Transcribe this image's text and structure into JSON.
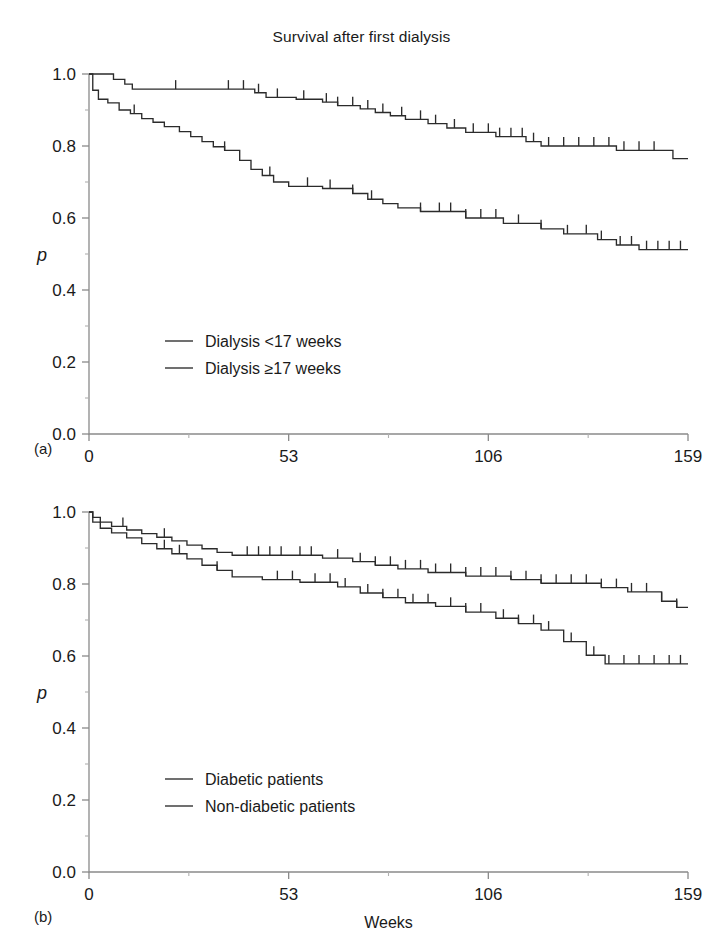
{
  "figure": {
    "title": "Survival after first dialysis",
    "background": "#ffffff",
    "line_color": "#2b2b2b",
    "axis_color": "#8a8a8a"
  },
  "panels": [
    {
      "tag": "(a)",
      "title": "Survival after first dialysis",
      "ylabel": "p",
      "xlabel": "Weeks"
    },
    {
      "tag": "(b)",
      "title": "",
      "ylabel": "p",
      "xlabel": "Weeks"
    }
  ],
  "axes": {
    "y_ticks": [
      "0.0",
      "0.2",
      "0.4",
      "0.6",
      "0.8",
      "1.0"
    ],
    "x_ticks": [
      "0",
      "53",
      "106",
      "159"
    ]
  },
  "legend_a": [
    {
      "label": "Dialysis <17 weeks"
    },
    {
      "label": "Dialysis ≥17 weeks"
    }
  ],
  "legend_b": [
    {
      "label": "Diabetic patients"
    },
    {
      "label": "Non-diabetic patients"
    }
  ],
  "chart_data": [
    {
      "type": "line",
      "plot_kind": "kaplan-meier-step",
      "panel": "(a)",
      "title": "Survival after first dialysis",
      "xlabel": "Weeks",
      "ylabel": "p",
      "xlim": [
        0,
        159
      ],
      "ylim": [
        0.0,
        1.0
      ],
      "xticks": [
        0,
        53,
        106,
        159
      ],
      "yticks": [
        0.0,
        0.2,
        0.4,
        0.6,
        0.8,
        1.0
      ],
      "grid": false,
      "legend_position": "inside-lower-left",
      "series": [
        {
          "name": "Dialysis <17 weeks",
          "points": [
            [
              0,
              1.0
            ],
            [
              6.5,
              1.0
            ],
            [
              6.5,
              0.985
            ],
            [
              9.5,
              0.985
            ],
            [
              9.5,
              0.972
            ],
            [
              11.5,
              0.972
            ],
            [
              11.5,
              0.958
            ],
            [
              18,
              0.958
            ],
            [
              18,
              0.958
            ],
            [
              44,
              0.958
            ],
            [
              44,
              0.948
            ],
            [
              47,
              0.948
            ],
            [
              47,
              0.935
            ],
            [
              55,
              0.935
            ],
            [
              55,
              0.93
            ],
            [
              62,
              0.93
            ],
            [
              62,
              0.922
            ],
            [
              66,
              0.922
            ],
            [
              66,
              0.912
            ],
            [
              72,
              0.912
            ],
            [
              72,
              0.903
            ],
            [
              76,
              0.903
            ],
            [
              76,
              0.893
            ],
            [
              80,
              0.893
            ],
            [
              80,
              0.884
            ],
            [
              84,
              0.884
            ],
            [
              84,
              0.874
            ],
            [
              90,
              0.874
            ],
            [
              90,
              0.862
            ],
            [
              95,
              0.862
            ],
            [
              95,
              0.85
            ],
            [
              100,
              0.85
            ],
            [
              100,
              0.838
            ],
            [
              108,
              0.838
            ],
            [
              108,
              0.826
            ],
            [
              116,
              0.826
            ],
            [
              116,
              0.812
            ],
            [
              120,
              0.812
            ],
            [
              120,
              0.8
            ],
            [
              140,
              0.8
            ],
            [
              140,
              0.788
            ],
            [
              152,
              0.788
            ],
            [
              155,
              0.788
            ],
            [
              155,
              0.765
            ],
            [
              159,
              0.765
            ]
          ],
          "censored_x": [
            23,
            37,
            41,
            45,
            50,
            57,
            63,
            66,
            70,
            74,
            78,
            83,
            88,
            92,
            97,
            102,
            106,
            109,
            112,
            115,
            118,
            122,
            126,
            130,
            134,
            138,
            142,
            146,
            150
          ]
        },
        {
          "name": "Dialysis ≥17 weeks",
          "points": [
            [
              0,
              1.0
            ],
            [
              1,
              1.0
            ],
            [
              1,
              0.955
            ],
            [
              2.5,
              0.955
            ],
            [
              2.5,
              0.93
            ],
            [
              5,
              0.93
            ],
            [
              5,
              0.92
            ],
            [
              8,
              0.92
            ],
            [
              8,
              0.9
            ],
            [
              11,
              0.9
            ],
            [
              11,
              0.89
            ],
            [
              14,
              0.89
            ],
            [
              14,
              0.876
            ],
            [
              17,
              0.876
            ],
            [
              17,
              0.866
            ],
            [
              20,
              0.866
            ],
            [
              20,
              0.854
            ],
            [
              24,
              0.854
            ],
            [
              24,
              0.84
            ],
            [
              27,
              0.84
            ],
            [
              27,
              0.826
            ],
            [
              30,
              0.826
            ],
            [
              30,
              0.812
            ],
            [
              33,
              0.812
            ],
            [
              33,
              0.798
            ],
            [
              36,
              0.798
            ],
            [
              36,
              0.788
            ],
            [
              40,
              0.788
            ],
            [
              40,
              0.76
            ],
            [
              43,
              0.76
            ],
            [
              43,
              0.735
            ],
            [
              46,
              0.735
            ],
            [
              46,
              0.718
            ],
            [
              49,
              0.718
            ],
            [
              49,
              0.7
            ],
            [
              53,
              0.7
            ],
            [
              53,
              0.688
            ],
            [
              62,
              0.688
            ],
            [
              62,
              0.682
            ],
            [
              70,
              0.682
            ],
            [
              70,
              0.668
            ],
            [
              74,
              0.668
            ],
            [
              74,
              0.652
            ],
            [
              78,
              0.652
            ],
            [
              78,
              0.64
            ],
            [
              82,
              0.64
            ],
            [
              82,
              0.628
            ],
            [
              88,
              0.628
            ],
            [
              88,
              0.618
            ],
            [
              100,
              0.618
            ],
            [
              100,
              0.6
            ],
            [
              110,
              0.6
            ],
            [
              110,
              0.585
            ],
            [
              120,
              0.585
            ],
            [
              120,
              0.57
            ],
            [
              126,
              0.57
            ],
            [
              126,
              0.556
            ],
            [
              135,
              0.556
            ],
            [
              135,
              0.54
            ],
            [
              140,
              0.54
            ],
            [
              140,
              0.525
            ],
            [
              146,
              0.525
            ],
            [
              146,
              0.512
            ],
            [
              159,
              0.512
            ]
          ],
          "censored_x": [
            12,
            36,
            48,
            58,
            64,
            70,
            75,
            88,
            93,
            96,
            100,
            104,
            108,
            114,
            120,
            127,
            132,
            136,
            141,
            144,
            148,
            151,
            154,
            157
          ]
        }
      ]
    },
    {
      "type": "line",
      "plot_kind": "kaplan-meier-step",
      "panel": "(b)",
      "title": "",
      "xlabel": "Weeks",
      "ylabel": "p",
      "xlim": [
        0,
        159
      ],
      "ylim": [
        0.0,
        1.0
      ],
      "xticks": [
        0,
        53,
        106,
        159
      ],
      "yticks": [
        0.0,
        0.2,
        0.4,
        0.6,
        0.8,
        1.0
      ],
      "grid": false,
      "legend_position": "inside-lower-left",
      "series": [
        {
          "name": "Diabetic patients",
          "points": [
            [
              0,
              1.0
            ],
            [
              1,
              1.0
            ],
            [
              1,
              0.985
            ],
            [
              3,
              0.985
            ],
            [
              3,
              0.972
            ],
            [
              6,
              0.972
            ],
            [
              6,
              0.96
            ],
            [
              10,
              0.96
            ],
            [
              10,
              0.95
            ],
            [
              14,
              0.95
            ],
            [
              14,
              0.94
            ],
            [
              18,
              0.94
            ],
            [
              18,
              0.93
            ],
            [
              22,
              0.93
            ],
            [
              22,
              0.92
            ],
            [
              26,
              0.92
            ],
            [
              26,
              0.908
            ],
            [
              30,
              0.908
            ],
            [
              30,
              0.898
            ],
            [
              34,
              0.898
            ],
            [
              34,
              0.888
            ],
            [
              38,
              0.888
            ],
            [
              38,
              0.88
            ],
            [
              62,
              0.88
            ],
            [
              62,
              0.872
            ],
            [
              70,
              0.872
            ],
            [
              70,
              0.862
            ],
            [
              76,
              0.862
            ],
            [
              76,
              0.852
            ],
            [
              82,
              0.852
            ],
            [
              82,
              0.842
            ],
            [
              90,
              0.842
            ],
            [
              90,
              0.832
            ],
            [
              100,
              0.832
            ],
            [
              100,
              0.822
            ],
            [
              112,
              0.822
            ],
            [
              112,
              0.812
            ],
            [
              120,
              0.812
            ],
            [
              120,
              0.802
            ],
            [
              136,
              0.802
            ],
            [
              136,
              0.79
            ],
            [
              143,
              0.79
            ],
            [
              143,
              0.778
            ],
            [
              152,
              0.778
            ],
            [
              152,
              0.752
            ],
            [
              156,
              0.752
            ],
            [
              156,
              0.735
            ],
            [
              159,
              0.735
            ]
          ],
          "censored_x": [
            9,
            20,
            42,
            45,
            48,
            51,
            56,
            59,
            66,
            72,
            76,
            80,
            84,
            88,
            92,
            96,
            100,
            104,
            108,
            112,
            116,
            120,
            124,
            128,
            132,
            136,
            140,
            144,
            148,
            152,
            156
          ]
        },
        {
          "name": "Non-diabetic patients",
          "points": [
            [
              0,
              1.0
            ],
            [
              1,
              1.0
            ],
            [
              1,
              0.972
            ],
            [
              3,
              0.972
            ],
            [
              3,
              0.955
            ],
            [
              6,
              0.955
            ],
            [
              6,
              0.942
            ],
            [
              10,
              0.942
            ],
            [
              10,
              0.928
            ],
            [
              14,
              0.928
            ],
            [
              14,
              0.912
            ],
            [
              18,
              0.912
            ],
            [
              18,
              0.898
            ],
            [
              22,
              0.898
            ],
            [
              22,
              0.884
            ],
            [
              26,
              0.884
            ],
            [
              26,
              0.87
            ],
            [
              30,
              0.87
            ],
            [
              30,
              0.852
            ],
            [
              34,
              0.852
            ],
            [
              34,
              0.838
            ],
            [
              38,
              0.838
            ],
            [
              38,
              0.82
            ],
            [
              46,
              0.82
            ],
            [
              46,
              0.812
            ],
            [
              56,
              0.812
            ],
            [
              56,
              0.805
            ],
            [
              66,
              0.805
            ],
            [
              66,
              0.792
            ],
            [
              72,
              0.792
            ],
            [
              72,
              0.775
            ],
            [
              78,
              0.775
            ],
            [
              78,
              0.762
            ],
            [
              84,
              0.762
            ],
            [
              84,
              0.748
            ],
            [
              92,
              0.748
            ],
            [
              92,
              0.738
            ],
            [
              100,
              0.738
            ],
            [
              100,
              0.722
            ],
            [
              108,
              0.722
            ],
            [
              108,
              0.705
            ],
            [
              114,
              0.705
            ],
            [
              114,
              0.69
            ],
            [
              120,
              0.69
            ],
            [
              120,
              0.672
            ],
            [
              126,
              0.672
            ],
            [
              126,
              0.64
            ],
            [
              132,
              0.64
            ],
            [
              132,
              0.602
            ],
            [
              137,
              0.602
            ],
            [
              137,
              0.578
            ],
            [
              159,
              0.578
            ]
          ],
          "censored_x": [
            20,
            24,
            34,
            50,
            54,
            60,
            64,
            68,
            74,
            78,
            82,
            86,
            90,
            96,
            100,
            104,
            110,
            114,
            118,
            122,
            128,
            134,
            138,
            142,
            146,
            150,
            154,
            157
          ]
        }
      ]
    }
  ]
}
